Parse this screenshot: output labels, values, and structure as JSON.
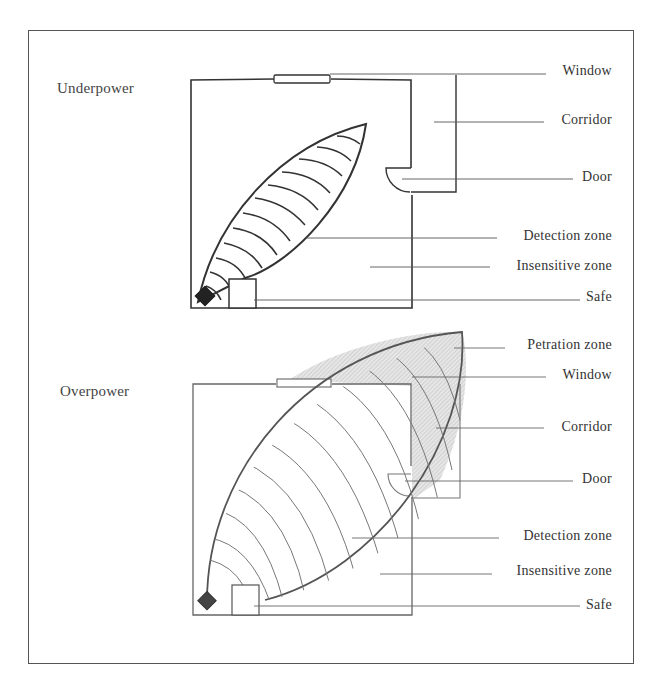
{
  "figure": {
    "panels": [
      {
        "id": "underpower",
        "title": "Underpower",
        "labels": {
          "window": "Window",
          "corridor": "Corridor",
          "door": "Door",
          "detection_zone": "Detection zone",
          "insensitive_zone": "Insensitive zone",
          "safe": "Safe"
        }
      },
      {
        "id": "overpower",
        "title": "Overpower",
        "labels": {
          "penetration_zone": "Petration zone",
          "window": "Window",
          "corridor": "Corridor",
          "door": "Door",
          "detection_zone": "Detection zone",
          "insensitive_zone": "Insensitive zone",
          "safe": "Safe"
        }
      }
    ],
    "colors": {
      "line": "#333333",
      "sensor": "#222222",
      "hatch_fill": "#d9d9d9",
      "background": "#ffffff"
    }
  }
}
